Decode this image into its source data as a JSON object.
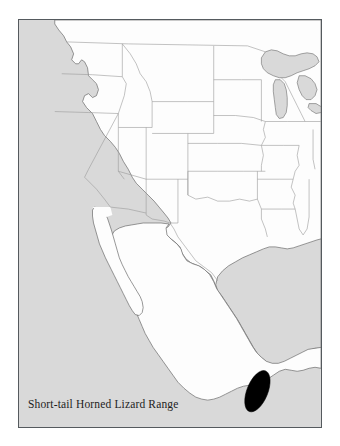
{
  "figure": {
    "caption": "Short-tail Horned Lizard Range",
    "title": "Short-tail Horned Lizard Range"
  },
  "map": {
    "type": "range-distribution-map",
    "region": "Western and central North America (United States and Mexico)",
    "projection_note": "Conic projection, frame cropped at continental margins",
    "legend_label": "Short-tail Horned Lizard Range",
    "range_feature": {
      "name": "short-tail-horned-lizard-range-polygon",
      "style": "solid black ellipse",
      "location_description": "Southern Mexico, inland from the Pacific coast near the state of Oaxaca",
      "count": 1
    },
    "features": {
      "land_label": "Land",
      "water_label": "Water",
      "state_borders_label": "State and national boundaries",
      "range_label": "Species range"
    }
  },
  "colors": {
    "page_background": "#ffffff",
    "frame_border": "#555a5e",
    "water": "#d9d9d9",
    "land": "#fdfdfd",
    "coastline": "#6a6a6a",
    "state_border": "#9a9a9a",
    "range_fill": "#000000",
    "caption_text": "#1d1d1d"
  },
  "frame": {
    "x": 18,
    "y": 19,
    "width": 304,
    "height": 409
  }
}
